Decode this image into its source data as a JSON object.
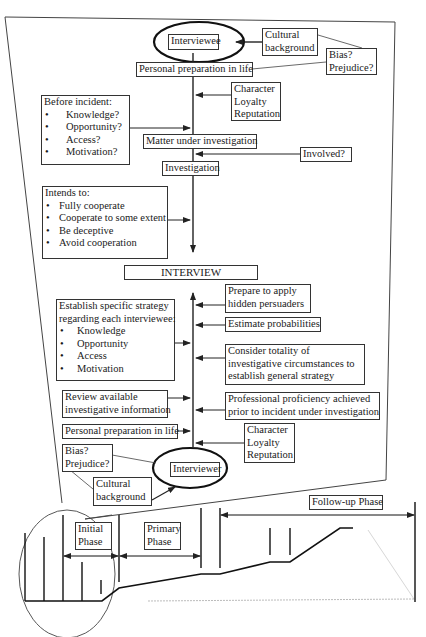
{
  "diagram": {
    "top_node": "Interviewee",
    "bottom_node": "Interviewer",
    "center_node": "INTERVIEW",
    "interviewee_side": {
      "cultural_background": "Cultural background",
      "cultural_background_lines": [
        "Cultural",
        "background"
      ],
      "bias_lines": [
        "Bias?",
        "Prejudice?"
      ],
      "personal_preparation": "Personal preparation in life",
      "character_lines": [
        "Character",
        "Loyalty",
        "Reputation"
      ],
      "before_incident": {
        "title": "Before incident:",
        "items": [
          "Knowledge?",
          "Opportunity?",
          "Access?",
          "Motivation?"
        ]
      },
      "matter_under_investigation": "Matter under investigation",
      "involved": "Involved?",
      "investigation": "Investigation",
      "intends_to": {
        "title": "Intends to:",
        "items": [
          "Fully cooperate",
          "Cooperate to some extent",
          "Be deceptive",
          "Avoid cooperation"
        ]
      }
    },
    "interviewer_side": {
      "strategy": {
        "title_lines": [
          "Establish specific strategy",
          "regarding each interviewee:"
        ],
        "items": [
          "Knowledge",
          "Opportunity",
          "Access",
          "Motivation"
        ]
      },
      "hidden_persuaders_lines": [
        "Prepare to apply",
        "hidden persuaders"
      ],
      "estimate_probabilities": "Estimate probabilities",
      "totality_lines": [
        "Consider totality of",
        "investigative circumstances to",
        "establish general strategy"
      ],
      "review_lines": [
        "Review available",
        "investigative information"
      ],
      "proficiency_lines": [
        "Professional proficiency achieved",
        "prior to incident under investigation"
      ],
      "personal_preparation": "Personal preparation in life",
      "character_lines": [
        "Character",
        "Loyalty",
        "Reputation"
      ],
      "bias_lines": [
        "Bias?",
        "Prejudice?"
      ],
      "cultural_background_lines": [
        "Cultural",
        "background"
      ]
    },
    "timeline": {
      "phases": [
        {
          "lines": [
            "Initial",
            "Phase"
          ]
        },
        {
          "lines": [
            "Primary",
            "Phase"
          ]
        },
        {
          "lines": [
            "Follow-up Phase"
          ]
        }
      ]
    }
  }
}
